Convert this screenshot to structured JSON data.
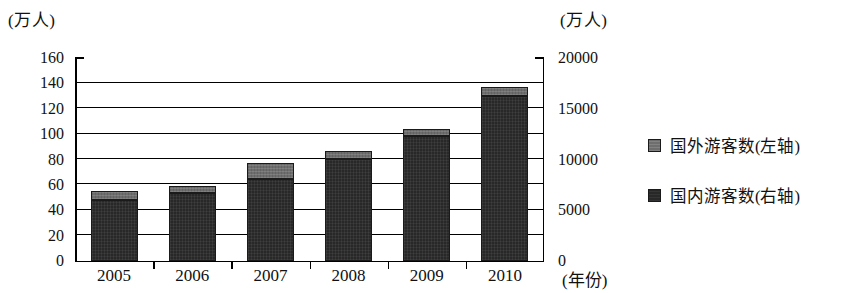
{
  "chart_data": {
    "type": "bar",
    "title": "",
    "subtitle": "",
    "stacked": true,
    "categories": [
      "2005",
      "2006",
      "2007",
      "2008",
      "2009",
      "2010"
    ],
    "xlabel": "(年份)",
    "ylabel_left": "(万人)",
    "ylabel_right": "(万人)",
    "ylim_left": [
      0,
      160
    ],
    "ylim_right": [
      0,
      20000
    ],
    "yticks_left": [
      0,
      20,
      40,
      60,
      80,
      100,
      120,
      140,
      160
    ],
    "yticks_right": [
      0,
      5000,
      10000,
      15000,
      20000
    ],
    "grid": true,
    "legend_position": "right",
    "series": [
      {
        "name": "国外游客数(左轴)",
        "axis": "left",
        "unit": "万人",
        "color": "#6e6e6e",
        "values": [
          7,
          5,
          13,
          6,
          6,
          7
        ]
      },
      {
        "name": "国内游客数(右轴)",
        "axis": "right",
        "unit": "万人",
        "color": "#282828",
        "values": [
          5900,
          6750,
          8000,
          10100,
          12250,
          16250
        ]
      }
    ],
    "stack_tops_left_axis": [
      54.5,
      58.5,
      76.5,
      86,
      104,
      137
    ],
    "domestic_tops_left_axis": [
      47.5,
      53.5,
      64,
      80,
      98,
      130
    ]
  },
  "axes": {
    "left_title": "(万人)",
    "right_title": "(万人)",
    "x_title": "(年份)",
    "left_ticks": [
      "160",
      "140",
      "120",
      "100",
      "80",
      "60",
      "40",
      "20",
      "0"
    ],
    "right_ticks": [
      "20000",
      "15000",
      "10000",
      "5000",
      "0"
    ]
  },
  "legend": {
    "items": [
      {
        "label": "国外游客数(左轴)",
        "swatch": "legend-swatch-foreign"
      },
      {
        "label": "国内游客数(右轴)",
        "swatch": "legend-swatch-domestic"
      }
    ]
  }
}
